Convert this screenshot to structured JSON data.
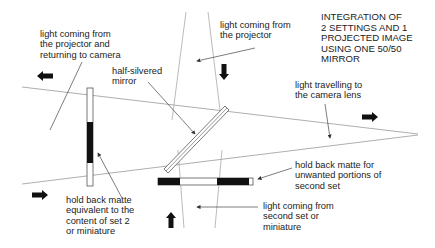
{
  "title": "INTEGRATION OF\n2 SETTINGS AND 1\nPROJECTED IMAGE\nUSING ONE 50/50\nMIRROR",
  "labels": {
    "projector_return": "light coming from\nthe projector and\nreturning to camera",
    "projector": "light coming from\nthe projector",
    "half_silvered_mirror": "half-silvered\nmirror",
    "camera_lens": "light travelling to\nthe camera lens",
    "hold_back_matte_set2": "hold back matte\nequivalent to the\ncontent of set 2\nor miniature",
    "hold_back_matte_second_set": "hold back matte for\nunwanted portions of\nsecond set",
    "second_set_light": "light coming from\nsecond set or\nminiature"
  },
  "colors": {
    "line": "#888888",
    "leader": "#444444",
    "fill": "#111111",
    "text": "#222222"
  }
}
